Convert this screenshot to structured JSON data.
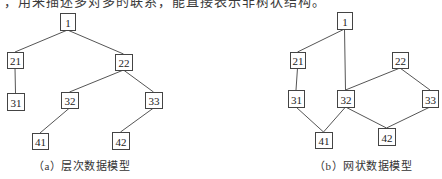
{
  "header_fragment": {
    "text": "，用来描述多对多的联系，能直接表示非树状结构。"
  },
  "diagrams": [
    {
      "id": "a",
      "caption": "（a）层次数据模型",
      "nodes": [
        {
          "id": "1",
          "label": "1",
          "x": 60,
          "y": 13,
          "w": 15,
          "h": 17
        },
        {
          "id": "21",
          "label": "21",
          "x": 7,
          "y": 52,
          "w": 16,
          "h": 16
        },
        {
          "id": "22",
          "label": "22",
          "x": 115,
          "y": 54,
          "w": 17,
          "h": 16
        },
        {
          "id": "31",
          "label": "31",
          "x": 7,
          "y": 93,
          "w": 17,
          "h": 17
        },
        {
          "id": "32",
          "label": "32",
          "x": 61,
          "y": 92,
          "w": 17,
          "h": 16
        },
        {
          "id": "33",
          "label": "33",
          "x": 145,
          "y": 92,
          "w": 17,
          "h": 16
        },
        {
          "id": "41",
          "label": "41",
          "x": 32,
          "y": 133,
          "w": 16,
          "h": 16
        },
        {
          "id": "42",
          "label": "42",
          "x": 112,
          "y": 132,
          "w": 17,
          "h": 17
        }
      ],
      "edges": [
        [
          "1",
          "21"
        ],
        [
          "1",
          "22"
        ],
        [
          "21",
          "31"
        ],
        [
          "22",
          "32"
        ],
        [
          "22",
          "33"
        ],
        [
          "32",
          "41"
        ],
        [
          "33",
          "42"
        ]
      ]
    },
    {
      "id": "b",
      "caption": "（b）网状数据模型",
      "nodes": [
        {
          "id": "1",
          "label": "1",
          "x": 337,
          "y": 12,
          "w": 15,
          "h": 17
        },
        {
          "id": "21",
          "label": "21",
          "x": 290,
          "y": 52,
          "w": 15,
          "h": 16
        },
        {
          "id": "22",
          "label": "22",
          "x": 392,
          "y": 52,
          "w": 16,
          "h": 16
        },
        {
          "id": "31",
          "label": "31",
          "x": 288,
          "y": 90,
          "w": 16,
          "h": 17
        },
        {
          "id": "32",
          "label": "32",
          "x": 337,
          "y": 90,
          "w": 17,
          "h": 17
        },
        {
          "id": "33",
          "label": "33",
          "x": 422,
          "y": 90,
          "w": 16,
          "h": 17
        },
        {
          "id": "41",
          "label": "41",
          "x": 315,
          "y": 132,
          "w": 17,
          "h": 16
        },
        {
          "id": "42",
          "label": "42",
          "x": 378,
          "y": 128,
          "w": 17,
          "h": 17
        }
      ],
      "edges": [
        [
          "1",
          "21"
        ],
        [
          "1",
          "32"
        ],
        [
          "21",
          "31"
        ],
        [
          "22",
          "32"
        ],
        [
          "22",
          "33"
        ],
        [
          "31",
          "41"
        ],
        [
          "32",
          "41"
        ],
        [
          "32",
          "42"
        ],
        [
          "33",
          "42"
        ]
      ]
    }
  ]
}
